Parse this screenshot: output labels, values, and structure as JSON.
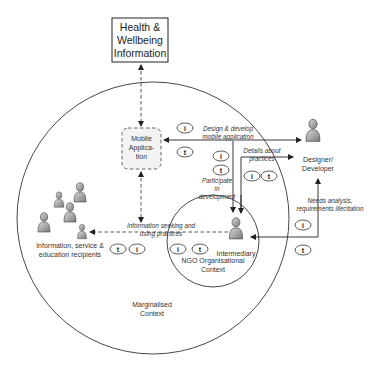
{
  "diagram": {
    "top_box": {
      "lines": [
        "Health &",
        "Wellbeing",
        "Information"
      ]
    },
    "mobile_app": {
      "lines": [
        "Mobile",
        "Applica-",
        "tion"
      ]
    },
    "designer": {
      "lines": [
        "Designer/",
        "Developer"
      ]
    },
    "intermediary": {
      "label": "Intermediary"
    },
    "ngo_context": {
      "lines": [
        "NGO Organisational",
        "Context"
      ]
    },
    "marginalised_context": {
      "lines": [
        "Marginalised",
        "Context"
      ]
    },
    "recipients": {
      "lines": [
        "Information, service &",
        "education recipients"
      ]
    },
    "edges": {
      "design_develop": {
        "lines": [
          "Design & develop",
          "mobile application"
        ]
      },
      "details_practices": {
        "lines": [
          "Details about",
          "practices"
        ]
      },
      "participate": {
        "lines": [
          "Participate",
          "in",
          "development"
        ]
      },
      "needs_analysis": {
        "lines": [
          "Needs analysis,",
          "requirements illecitation"
        ]
      },
      "info_seeking": {
        "lines": [
          "Information seeking and",
          "using practices"
        ]
      }
    },
    "badges": {
      "i": "i",
      "t": "t"
    }
  }
}
